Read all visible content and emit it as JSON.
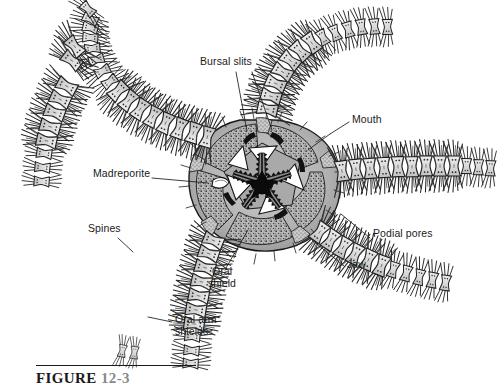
{
  "figure": {
    "organism": "brittle star (ophiuroid), oral (ventral) view",
    "caption_prefix": "FIGURE",
    "caption_number": "12-3",
    "background_color": "#ffffff",
    "ink_color": "#1a1a1a",
    "plate_fill": "#dcdcdc",
    "shield_fill": "#ffffff",
    "disc_fill": "#b4b4b4"
  },
  "labels": [
    {
      "id": "bursal-slits",
      "text": "Bursal slits",
      "x": 200,
      "y": 62,
      "align": "left"
    },
    {
      "id": "mouth",
      "text": "Mouth",
      "x": 352,
      "y": 120,
      "align": "left"
    },
    {
      "id": "madreporite",
      "text": "Madreporite",
      "x": 93,
      "y": 174,
      "align": "left"
    },
    {
      "id": "spines",
      "text": "Spines",
      "x": 88,
      "y": 229,
      "align": "left"
    },
    {
      "id": "podial-pores",
      "text": "Podial pores",
      "x": 373,
      "y": 234,
      "align": "left"
    },
    {
      "id": "jaw",
      "text": "Jaw",
      "x": 347,
      "y": 265,
      "align": "left"
    },
    {
      "id": "oral-shield",
      "text": "Oral\nshield",
      "x": 221,
      "y": 272,
      "align": "center"
    },
    {
      "id": "oral-arm-shields",
      "text": "Oral arm\nshields",
      "x": 175,
      "y": 320,
      "align": "left"
    }
  ],
  "arms": [
    {
      "id": "arm-upper-left",
      "direction": "upper-left, curving down"
    },
    {
      "id": "arm-upper-right",
      "direction": "up and to the right"
    },
    {
      "id": "arm-right",
      "direction": "right, horizontal"
    },
    {
      "id": "arm-lower-right",
      "direction": "lower-right"
    },
    {
      "id": "arm-lower-left",
      "direction": "down and to the left"
    }
  ],
  "disc_parts": [
    {
      "id": "mouth-star",
      "label": "five-rayed mouth opening"
    },
    {
      "id": "jaws",
      "label": "serrated jaw plates, 5"
    },
    {
      "id": "oral-shields",
      "label": "white triangular oral shields, 5"
    },
    {
      "id": "bursal-slit-pair",
      "label": "paired bursal slits"
    },
    {
      "id": "madreporite-plate",
      "label": "madreporite"
    },
    {
      "id": "interradial-areas",
      "label": "stippled interradial disc areas"
    }
  ]
}
